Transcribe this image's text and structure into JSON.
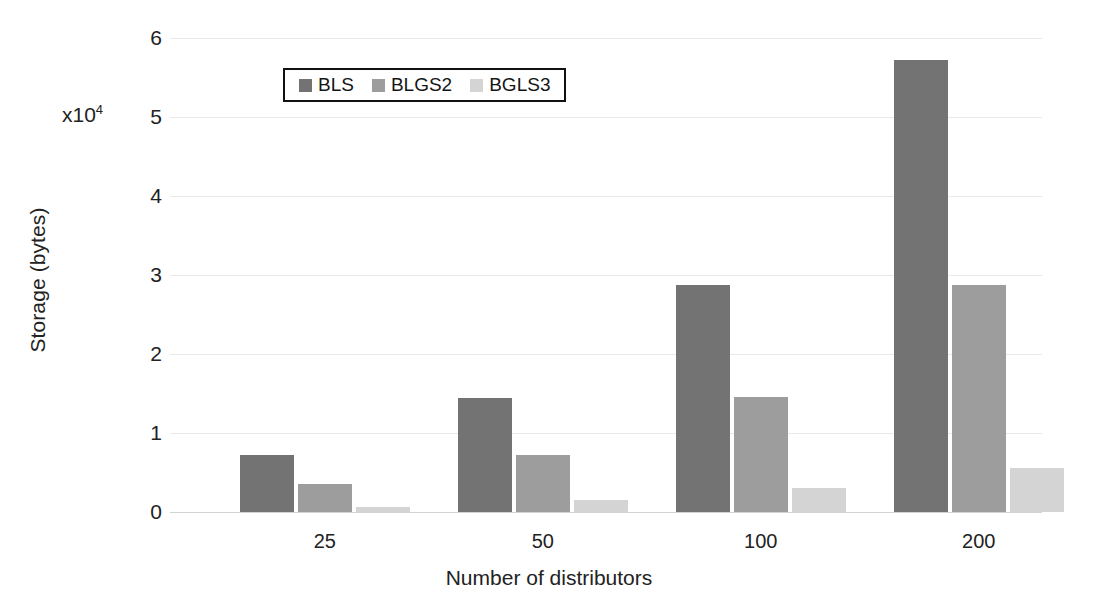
{
  "chart_data": {
    "type": "bar",
    "title": "",
    "xlabel": "Number of distributors",
    "ylabel": "Storage (bytes)",
    "y_multiplier": "x10",
    "y_multiplier_exponent": "4",
    "categories": [
      "25",
      "50",
      "100",
      "200"
    ],
    "yticks": [
      "0",
      "1",
      "2",
      "3",
      "4",
      "5",
      "6"
    ],
    "ylim": [
      0,
      6
    ],
    "grid": true,
    "legend_position": "top-left-inside",
    "series": [
      {
        "name": "BLS",
        "color": "#737373",
        "values": [
          0.72,
          1.44,
          2.87,
          5.72
        ]
      },
      {
        "name": "BLGS2",
        "color": "#9d9d9d",
        "values": [
          0.36,
          0.72,
          1.45,
          2.87
        ]
      },
      {
        "name": "BGLS3",
        "color": "#d4d4d4",
        "values": [
          0.06,
          0.15,
          0.3,
          0.56
        ]
      }
    ]
  },
  "axis": {
    "y_title": "Storage (bytes)",
    "x_title": "Number of distributors",
    "multiplier_base": "x10",
    "multiplier_exp": "4"
  }
}
